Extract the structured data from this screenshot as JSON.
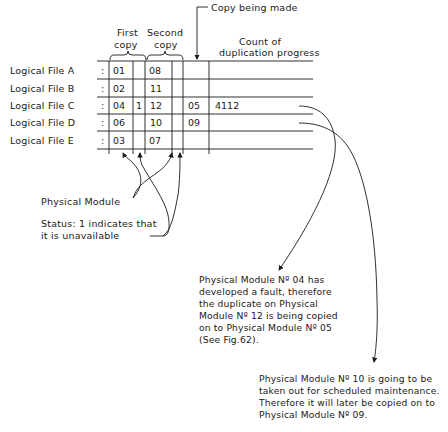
{
  "header": {
    "first_copy_line1": "First",
    "first_copy_line2": "copy",
    "second_copy_line1": "Second",
    "second_copy_line2": "copy",
    "copy_being_made": "Copy being made",
    "count_line1": "Count of",
    "count_line2": "duplication progress"
  },
  "rows": [
    {
      "label": "Logical File A",
      "sep": ":",
      "first": "01",
      "first_status": "",
      "second": "08",
      "second_status": "",
      "copy": "",
      "count": ""
    },
    {
      "label": "Logical File B",
      "sep": ":",
      "first": "02",
      "first_status": "",
      "second": "11",
      "second_status": "",
      "copy": "",
      "count": ""
    },
    {
      "label": "Logical File C",
      "sep": ":",
      "first": "04",
      "first_status": "1",
      "second": "12",
      "second_status": "",
      "copy": "05",
      "count": "4112"
    },
    {
      "label": "Logical File D",
      "sep": ":",
      "first": "06",
      "first_status": "",
      "second": "10",
      "second_status": "",
      "copy": "09",
      "count": ""
    },
    {
      "label": "Logical File E",
      "sep": ":",
      "first": "03",
      "first_status": "",
      "second": "07",
      "second_status": "",
      "copy": "",
      "count": ""
    }
  ],
  "annotations": {
    "physical_module": "Physical Module",
    "status_line1": "Status: 1 indicates that",
    "status_line2": "it is unavailable",
    "note1": [
      "Physical Module Nº 04 has",
      "developed a fault, therefore",
      "the duplicate on Physical",
      "Module Nº 12 is being copied",
      "on to Physical Module Nº 05",
      "(See Fig.62)."
    ],
    "note2": [
      "Physical Module Nº 10 is going to be",
      "taken out for scheduled maintenance.",
      "Therefore it will later be copied on to",
      "Physical Module Nº 09."
    ]
  }
}
